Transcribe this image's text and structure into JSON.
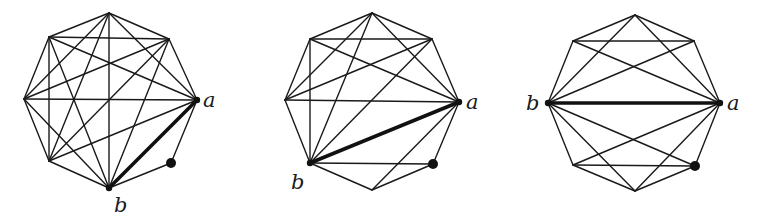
{
  "figure": {
    "background": "#ffffff",
    "stroke_color": "#1a1a1a",
    "graphs": [
      {
        "id": "graph-1",
        "vertices": [
          {
            "id": "v0",
            "x": 109,
            "y": 13
          },
          {
            "id": "v1",
            "x": 169,
            "y": 39
          },
          {
            "id": "v2",
            "x": 197,
            "y": 100,
            "label": "a",
            "lx": 203,
            "ly": 107,
            "marked": true
          },
          {
            "id": "v3",
            "x": 171,
            "y": 163,
            "dot": true
          },
          {
            "id": "v4",
            "x": 109,
            "y": 188,
            "label": "b",
            "lx": 114,
            "ly": 212,
            "marked": true
          },
          {
            "id": "v5",
            "x": 49,
            "y": 161
          },
          {
            "id": "v6",
            "x": 24,
            "y": 99
          },
          {
            "id": "v7",
            "x": 49,
            "y": 37
          }
        ],
        "thick_edge": [
          "v2",
          "v4"
        ],
        "edges": [
          [
            "v0",
            "v1"
          ],
          [
            "v1",
            "v2"
          ],
          [
            "v2",
            "v3"
          ],
          [
            "v3",
            "v4"
          ],
          [
            "v4",
            "v5"
          ],
          [
            "v5",
            "v6"
          ],
          [
            "v6",
            "v7"
          ],
          [
            "v7",
            "v0"
          ],
          [
            "v0",
            "v2"
          ],
          [
            "v0",
            "v4"
          ],
          [
            "v0",
            "v5"
          ],
          [
            "v0",
            "v6"
          ],
          [
            "v1",
            "v4"
          ],
          [
            "v1",
            "v5"
          ],
          [
            "v1",
            "v6"
          ],
          [
            "v1",
            "v7"
          ],
          [
            "v2",
            "v5"
          ],
          [
            "v2",
            "v6"
          ],
          [
            "v2",
            "v7"
          ],
          [
            "v4",
            "v6"
          ],
          [
            "v4",
            "v7"
          ],
          [
            "v5",
            "v7"
          ]
        ]
      },
      {
        "id": "graph-2",
        "vertices": [
          {
            "id": "v0",
            "x": 372,
            "y": 13
          },
          {
            "id": "v1",
            "x": 432,
            "y": 39
          },
          {
            "id": "v2",
            "x": 459,
            "y": 102,
            "label": "a",
            "lx": 466,
            "ly": 109,
            "marked": true
          },
          {
            "id": "v3",
            "x": 433,
            "y": 164,
            "dot": true
          },
          {
            "id": "v4",
            "x": 372,
            "y": 190
          },
          {
            "id": "v5",
            "x": 310,
            "y": 163,
            "label": "b",
            "lx": 291,
            "ly": 189,
            "marked": true
          },
          {
            "id": "v6",
            "x": 285,
            "y": 100
          },
          {
            "id": "v7",
            "x": 310,
            "y": 39
          }
        ],
        "thick_edge": [
          "v2",
          "v5"
        ],
        "edges": [
          [
            "v0",
            "v1"
          ],
          [
            "v1",
            "v2"
          ],
          [
            "v2",
            "v3"
          ],
          [
            "v3",
            "v4"
          ],
          [
            "v4",
            "v5"
          ],
          [
            "v5",
            "v6"
          ],
          [
            "v6",
            "v7"
          ],
          [
            "v7",
            "v0"
          ],
          [
            "v7",
            "v1"
          ],
          [
            "v6",
            "v2"
          ],
          [
            "v7",
            "v5"
          ],
          [
            "v5",
            "v3"
          ],
          [
            "v0",
            "v6"
          ],
          [
            "v0",
            "v5"
          ],
          [
            "v0",
            "v2"
          ],
          [
            "v7",
            "v2"
          ],
          [
            "v1",
            "v6"
          ],
          [
            "v1",
            "v5"
          ],
          [
            "v4",
            "v2"
          ]
        ]
      },
      {
        "id": "graph-3",
        "vertices": [
          {
            "id": "v0",
            "x": 635,
            "y": 15
          },
          {
            "id": "v1",
            "x": 694,
            "y": 41
          },
          {
            "id": "v2",
            "x": 720,
            "y": 103,
            "label": "a",
            "lx": 727,
            "ly": 110,
            "marked": true
          },
          {
            "id": "v3",
            "x": 695,
            "y": 166,
            "dot": true
          },
          {
            "id": "v4",
            "x": 635,
            "y": 191
          },
          {
            "id": "v5",
            "x": 573,
            "y": 165
          },
          {
            "id": "v6",
            "x": 548,
            "y": 103,
            "label": "b",
            "lx": 526,
            "ly": 110,
            "marked": true
          },
          {
            "id": "v7",
            "x": 573,
            "y": 41
          }
        ],
        "thick_edge": [
          "v2",
          "v6"
        ],
        "edges": [
          [
            "v0",
            "v1"
          ],
          [
            "v1",
            "v2"
          ],
          [
            "v2",
            "v3"
          ],
          [
            "v3",
            "v4"
          ],
          [
            "v4",
            "v5"
          ],
          [
            "v5",
            "v6"
          ],
          [
            "v6",
            "v7"
          ],
          [
            "v7",
            "v0"
          ],
          [
            "v7",
            "v1"
          ],
          [
            "v5",
            "v3"
          ],
          [
            "v0",
            "v6"
          ],
          [
            "v0",
            "v2"
          ],
          [
            "v7",
            "v2"
          ],
          [
            "v1",
            "v6"
          ],
          [
            "v6",
            "v3"
          ],
          [
            "v6",
            "v4"
          ],
          [
            "v2",
            "v5"
          ],
          [
            "v2",
            "v4"
          ]
        ]
      }
    ]
  }
}
